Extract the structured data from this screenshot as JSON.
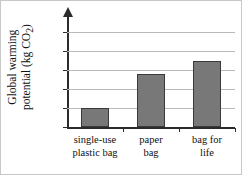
{
  "chart_data": {
    "type": "bar",
    "title": "",
    "xlabel": "",
    "ylabel": "Global warming potential (kg CO2)",
    "ylabel_line1": "Global warming",
    "ylabel_line2": "potential (kg CO",
    "ylabel_subscript": "2",
    "ylabel_line2_end": ")",
    "categories": [
      "single-use plastic bag",
      "paper bag",
      "bag for life"
    ],
    "category_lines": [
      [
        "single-use",
        "plastic bag"
      ],
      [
        "paper",
        "bag"
      ],
      [
        "bag for",
        "life"
      ]
    ],
    "values": [
      2.0,
      5.6,
      7.0
    ],
    "ylim": [
      0,
      11
    ],
    "yticks": [
      0,
      2,
      4,
      6,
      8,
      10
    ],
    "ytick_labels": [
      "0",
      "2",
      "4",
      "6",
      "8",
      "10"
    ],
    "grid": true,
    "legend": false,
    "bar_color": "#787878",
    "bar_edge_color": "#3a3a3a",
    "grid_color": "#b9b9b9",
    "axis_color": "#2b2b2b",
    "background_color": "#ffffff"
  }
}
